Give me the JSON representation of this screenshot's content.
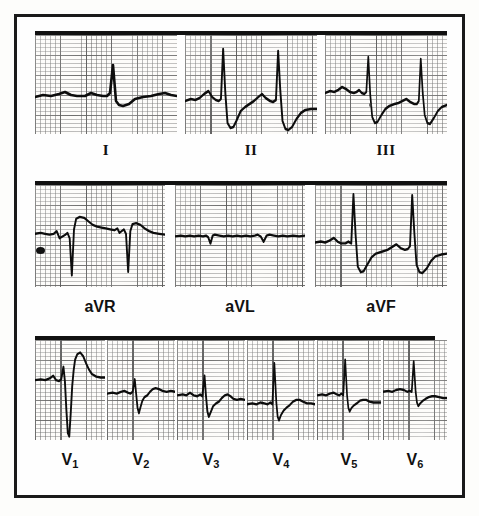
{
  "figure": {
    "kind": "12-lead-electrocardiogram",
    "border_color": "#1a1a1a",
    "trace_color": "#0d0d0d",
    "paper_color": "#fdfcfa",
    "grid_color": "#3c3c3c"
  },
  "rows": [
    {
      "id": "limb-leads",
      "labels": [
        "I",
        "II",
        "III"
      ]
    },
    {
      "id": "augmented-leads",
      "labels": [
        "aVR",
        "aVL",
        "aVF"
      ]
    },
    {
      "id": "precordial-leads",
      "labels": [
        "V1",
        "V2",
        "V3",
        "V4",
        "V5",
        "V6"
      ]
    }
  ],
  "leads": [
    {
      "name": "I",
      "label": "I",
      "row": 1,
      "beats": 2,
      "description": "small upright R waves, flat baseline, low amplitude",
      "r_amplitude_mm": 7,
      "s_amplitude_mm": 2
    },
    {
      "name": "II",
      "label": "II",
      "row": 1,
      "beats": 2,
      "description": "tall R waves with deep S waves",
      "r_amplitude_mm": 17,
      "s_amplitude_mm": 7
    },
    {
      "name": "III",
      "label": "III",
      "row": 1,
      "beats": 2,
      "description": "tall R waves with deep S waves",
      "r_amplitude_mm": 14,
      "s_amplitude_mm": 6
    },
    {
      "name": "aVR",
      "label": "aVR",
      "row": 2,
      "beats": 2,
      "description": "deep negative QS complexes with positive T hump",
      "r_amplitude_mm": 0,
      "s_amplitude_mm": 13
    },
    {
      "name": "aVL",
      "label": "aVL",
      "row": 2,
      "beats": 2,
      "description": "nearly isoelectric, tiny deflections only",
      "r_amplitude_mm": 1,
      "s_amplitude_mm": 2
    },
    {
      "name": "aVF",
      "label": "aVF",
      "row": 2,
      "beats": 2,
      "description": "tall R waves with deep S waves",
      "r_amplitude_mm": 16,
      "s_amplitude_mm": 8
    },
    {
      "name": "V1",
      "label": "V1",
      "label_base": "V",
      "label_sub": "1",
      "row": 3,
      "beats": 1,
      "description": "small r, very deep S, tall peaked T wave",
      "r_amplitude_mm": 5,
      "s_amplitude_mm": 16,
      "t_amplitude_mm": 11
    },
    {
      "name": "V2",
      "label": "V2",
      "label_base": "V",
      "label_sub": "2",
      "row": 3,
      "beats": 1,
      "description": "small R, S wave, low T wave",
      "r_amplitude_mm": 5,
      "s_amplitude_mm": 7,
      "t_amplitude_mm": 3
    },
    {
      "name": "V3",
      "label": "V3",
      "label_base": "V",
      "label_sub": "3",
      "row": 3,
      "beats": 1,
      "description": "modest R wave with S wave, small T",
      "r_amplitude_mm": 7,
      "s_amplitude_mm": 6,
      "t_amplitude_mm": 3
    },
    {
      "name": "V4",
      "label": "V4",
      "label_base": "V",
      "label_sub": "4",
      "row": 3,
      "beats": 1,
      "description": "tall R wave, S wave, upright T",
      "r_amplitude_mm": 13,
      "s_amplitude_mm": 5,
      "t_amplitude_mm": 3
    },
    {
      "name": "V5",
      "label": "V5",
      "label_base": "V",
      "label_sub": "5",
      "row": 3,
      "beats": 1,
      "description": "tall R wave, small S, upright T",
      "r_amplitude_mm": 12,
      "s_amplitude_mm": 3,
      "t_amplitude_mm": 2
    },
    {
      "name": "V6",
      "label": "V6",
      "label_base": "V",
      "label_sub": "6",
      "row": 3,
      "beats": 1,
      "description": "tall R wave, minimal S, upright T",
      "r_amplitude_mm": 10,
      "s_amplitude_mm": 2,
      "t_amplitude_mm": 2
    }
  ],
  "chart_data": {
    "type": "line",
    "title": "",
    "xlabel": "",
    "ylabel": "",
    "grid": true,
    "legend": "none",
    "series": [
      {
        "name": "I",
        "path": "M0,62 L8,60 L16,61 L24,59 L30,57 L36,60 L42,61 L50,61 L56,58 L62,60 L68,61 L72,61 L75,58 L78,30 L81,66 L84,70 L88,71 L94,69 L100,64 L108,62 L116,61 L124,59 L130,58 L136,60 L142,61 L148,61 L152,60 L155,57 L158,29 L161,65 L164,70 L168,71 L174,69 L180,64 L188,62 L196,61 L204,61"
      },
      {
        "name": "II",
        "path": "M0,66 L8,64 L14,65 L20,63 L26,59 L32,56 L37,62 L42,65 L46,66 L49,64 L52,14 L55,58 L58,88 L62,93 L66,92 L70,86 L76,76 L82,72 L88,69 L94,66 L100,62 L105,59 L110,63 L116,66 L120,67 L124,65 L127,16 L130,56 L133,86 L137,94 L141,95 L146,92 L152,84 L158,78 L164,75 L172,74 L180,74"
      },
      {
        "name": "III",
        "path": "M0,58 L8,56 L14,57 L20,55 L26,52 L32,54 L38,57 L44,58 L48,57 L52,55 L56,58 L60,59 L63,57 L66,22 L69,60 L72,82 L76,88 L80,87 L86,80 L92,74 L98,71 L106,69 L112,68 L118,66 L124,64 L130,67 L136,69 L140,69 L143,66 L146,24 L149,58 L152,80 L156,88 L160,89 L166,83 L172,76 L178,72 L186,70"
      },
      {
        "name": "aVR",
        "path": "M0,55 L8,54 L14,55 L20,56 L26,55 L30,52 L34,60 L38,58 L42,56 L45,54 L48,60 L51,102 L54,50 L57,38 L62,36 L68,37 L74,41 L80,45 L86,47 L92,48 L98,49 L104,50 L110,51 L114,49 L117,54 L120,52 L123,50 L126,55 L129,98 L132,52 L135,44 L140,43 L146,45 L152,49 L158,52 L164,54 L172,55 L180,56"
      },
      {
        "name": "aVL",
        "path": "M0,58 L8,57 L14,58 L20,57 L26,58 L32,57 L38,58 L42,57 L45,59 L48,66 L51,57 L54,56 L60,57 L66,58 L72,57 L78,58 L84,57 L90,58 L96,57 L102,58 L108,57 L112,56 L116,58 L120,64 L124,57 L128,56 L134,57 L140,58 L146,57 L152,58 L160,57 L168,58 L176,57"
      },
      {
        "name": "aVF",
        "path": "M0,62 L8,61 L14,62 L20,60 L26,57 L31,61 L36,63 L42,63 L46,61 L50,63 L53,10 L56,54 L59,88 L63,94 L67,93 L72,86 L78,78 L84,74 L92,72 L100,70 L106,67 L112,64 L118,68 L124,70 L128,69 L131,66 L134,11 L137,52 L140,86 L144,94 L148,95 L154,90 L160,82 L166,77 L174,75 L182,74"
      },
      {
        "name": "V1",
        "path": "M0,45 L8,44 L14,45 L20,43 L25,40 L29,45 L33,46 L36,44 L39,30 L41,46 L43,78 L45,104 L47,108 L49,82 L51,52 L53,34 L55,22 L58,16 L62,14 L66,18 L70,26 L74,33 L78,38 L84,41 L90,42 L96,42"
      },
      {
        "name": "V2",
        "path": "M0,60 L8,59 L14,60 L20,58 L25,57 L30,59 L34,60 L37,58 L40,44 L42,60 L44,76 L46,82 L48,76 L51,68 L54,64 L58,62 L62,58 L66,55 L70,54 L75,55 L80,57 L86,58 L92,57 L98,58"
      },
      {
        "name": "V3",
        "path": "M0,62 L8,61 L13,62 L18,59 L23,62 L28,63 L32,61 L35,63 L38,40 L40,62 L42,80 L44,86 L47,80 L50,74 L54,71 L58,69 L62,65 L66,62 L70,61 L74,63 L78,66 L83,67 L88,66 L94,67"
      },
      {
        "name": "V4",
        "path": "M0,72 L8,71 L14,72 L20,70 L26,71 L31,72 L35,70 L38,72 L41,26 L44,70 L46,86 L48,90 L51,84 L55,79 L59,76 L64,73 L69,69 L74,67 L79,67 L84,69 L90,71 L96,71 L102,72"
      },
      {
        "name": "V5",
        "path": "M0,62 L8,61 L14,62 L20,60 L26,59 L31,61 L35,62 L38,60 L41,62 L44,22 L47,62 L49,76 L51,80 L54,76 L58,73 L62,71 L67,68 L72,67 L77,67 L82,69 L88,70 L94,70 L100,70"
      },
      {
        "name": "V6",
        "path": "M0,58 L8,57 L14,58 L20,56 L26,55 L32,56 L37,58 L41,57 L44,58 L47,24 L50,58 L52,70 L54,74 L57,71 L61,68 L65,66 L70,64 L75,63 L80,63 L86,64 L92,65 L98,65"
      }
    ]
  }
}
